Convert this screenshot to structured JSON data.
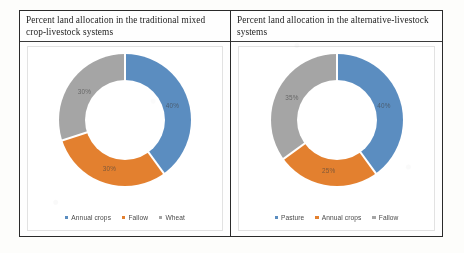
{
  "panels": [
    {
      "title": "Percent land allocation in the traditional mixed crop-livestock systems",
      "legend": [
        {
          "label": "Annual crops",
          "color": "#5B8DC0"
        },
        {
          "label": "Fallow",
          "color": "#E3802F"
        },
        {
          "label": "Wheat",
          "color": "#A5A5A5"
        }
      ]
    },
    {
      "title": "Percent land allocation in the alternative-livestock systems",
      "legend": [
        {
          "label": "Pasture",
          "color": "#5B8DC0"
        },
        {
          "label": "Annual crops",
          "color": "#E3802F"
        },
        {
          "label": "Fallow",
          "color": "#A5A5A5"
        }
      ]
    }
  ],
  "chart_data": [
    {
      "type": "pie",
      "title": "Percent land allocation in the traditional mixed crop-livestock systems",
      "categories": [
        "Annual crops",
        "Fallow",
        "Wheat"
      ],
      "values": [
        40,
        30,
        30
      ],
      "labels": [
        "40%",
        "30%",
        "30%"
      ],
      "colors": [
        "#5B8DC0",
        "#E3802F",
        "#A5A5A5"
      ],
      "donut": true,
      "legend_position": "bottom",
      "units": "percent"
    },
    {
      "type": "pie",
      "title": "Percent land allocation in the alternative-livestock systems",
      "categories": [
        "Pasture",
        "Annual crops",
        "Fallow"
      ],
      "values": [
        40,
        25,
        35
      ],
      "labels": [
        "40%",
        "25%",
        "35%"
      ],
      "colors": [
        "#5B8DC0",
        "#E3802F",
        "#A5A5A5"
      ],
      "donut": true,
      "legend_position": "bottom",
      "units": "percent"
    }
  ]
}
